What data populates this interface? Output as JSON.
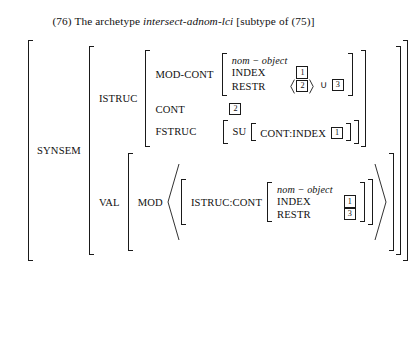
{
  "caption": {
    "number": "(76)",
    "text_before": "The archetype",
    "italic_term": "intersect-adnom-lci",
    "text_after": "[subtype of (75)]",
    "full": "(76) The archetype intersect-adnom-lci [subtype of (75)]"
  },
  "avm": {
    "root_attribute": "SYNSEM",
    "istruc": {
      "label": "ISTRUC",
      "mod_cont": {
        "label": "MOD-CONT",
        "type": "nom − object",
        "rows": [
          {
            "attr": "INDEX",
            "tag": "1"
          },
          {
            "attr": "RESTR",
            "list_tag": "2",
            "union": "∪",
            "union_tag": "3"
          }
        ]
      },
      "cont": {
        "label": "CONT",
        "tag": "2"
      },
      "fstruc": {
        "label": "FSTRUC",
        "su_label": "SU",
        "su_attr": "CONT:INDEX",
        "su_tag": "1"
      }
    },
    "val": {
      "label": "VAL",
      "mod": {
        "label": "MOD",
        "list_item": {
          "attr": "ISTRUC:CONT",
          "type": "nom − object",
          "rows": [
            {
              "attr": "INDEX",
              "tag": "1"
            },
            {
              "attr": "RESTR",
              "tag": "3"
            }
          ]
        }
      }
    }
  },
  "colors": {
    "ink": "#111111",
    "rule": "#1a1a1a",
    "background": "#ffffff"
  }
}
